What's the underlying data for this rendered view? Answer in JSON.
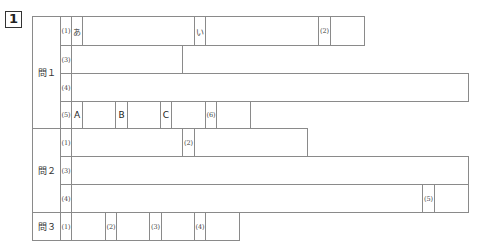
{
  "question_number": "1",
  "sections": {
    "q1": {
      "label": "問１",
      "rows": {
        "r1": {
          "num": "(1)",
          "a_label": "あ",
          "i_label": "い",
          "n2": "(2)"
        },
        "r3": {
          "num": "(3)"
        },
        "r4": {
          "num": "(4)"
        },
        "r5": {
          "num": "(5)",
          "A": "A",
          "B": "B",
          "C": "C",
          "n6": "(6)"
        }
      }
    },
    "q2": {
      "label": "問２",
      "rows": {
        "r1": {
          "num": "(1)",
          "n2": "(2)"
        },
        "r3": {
          "num": "(3)"
        },
        "r4": {
          "num": "(4)",
          "n5": "(5)"
        }
      }
    },
    "q3": {
      "label": "問３",
      "n1": "(1)",
      "n2": "(2)",
      "n3": "(3)",
      "n4": "(4)"
    }
  }
}
